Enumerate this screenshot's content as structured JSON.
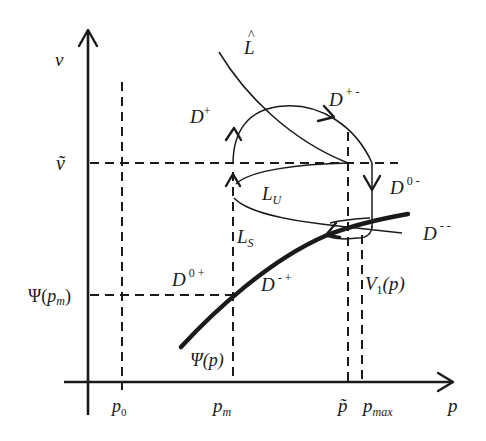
{
  "figure": {
    "type": "phase-diagram",
    "axes": {
      "x_label": "p",
      "y_label": "v"
    },
    "x_ticks": [
      {
        "label": "p",
        "subscript": "0",
        "name": "p0"
      },
      {
        "label": "p",
        "subscript": "m",
        "name": "pm"
      },
      {
        "label": "p̃",
        "subscript": "",
        "name": "p-tilde"
      },
      {
        "label": "p",
        "subscript": "max",
        "name": "pmax"
      }
    ],
    "y_ticks": [
      {
        "label": "ṽ",
        "name": "v-tilde"
      },
      {
        "label": "Ψ(",
        "sub_p": "p",
        "subscript": "m",
        "close": ")",
        "name": "psi-pm"
      }
    ],
    "curves": {
      "L_hat": {
        "label": "L",
        "accent": "^"
      },
      "L_U": {
        "label": "L",
        "subscript": "U"
      },
      "L_S": {
        "label": "L",
        "subscript": "S"
      },
      "psi": {
        "label": "Ψ(p)"
      },
      "V1": {
        "label": "V",
        "subscript": "1",
        "suffix": "(p)"
      }
    },
    "regions": [
      {
        "name": "D-plus",
        "label": "D",
        "superscript": "+"
      },
      {
        "name": "D-plus-minus",
        "label": "D",
        "superscript": "+ -"
      },
      {
        "name": "D-zero-minus",
        "label": "D",
        "superscript": "0 -"
      },
      {
        "name": "D-minus-minus",
        "label": "D",
        "superscript": "- -"
      },
      {
        "name": "D-zero-plus",
        "label": "D",
        "superscript": "0 +"
      },
      {
        "name": "D-minus-plus",
        "label": "D",
        "superscript": "- +"
      }
    ]
  }
}
